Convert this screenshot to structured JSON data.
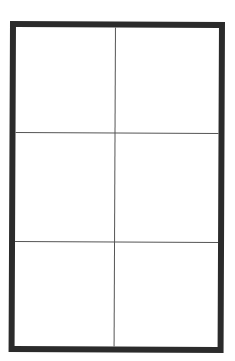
{
  "diagram": {
    "type": "grid",
    "columns": 2,
    "rows": 3,
    "cells": [
      {
        "row": 1,
        "col": 1,
        "label": ""
      },
      {
        "row": 1,
        "col": 2,
        "label": ""
      },
      {
        "row": 2,
        "col": 1,
        "label": ""
      },
      {
        "row": 2,
        "col": 2,
        "label": ""
      },
      {
        "row": 3,
        "col": 1,
        "label": ""
      },
      {
        "row": 3,
        "col": 2,
        "label": ""
      }
    ],
    "colors": {
      "border": "#2b2b2b",
      "grid_line": "#555555",
      "fill": "#ffffff"
    }
  }
}
